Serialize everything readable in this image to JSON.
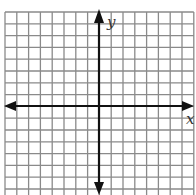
{
  "diagram": {
    "type": "coordinate-plane",
    "labels": {
      "x_axis": "x",
      "y_axis": "y"
    },
    "grid": {
      "columns": 16,
      "rows_visible": 16,
      "origin_px": [
        99,
        106
      ],
      "cell_px": 11.8,
      "grid_left_px": 5,
      "grid_top_px": 12,
      "tick_labels": false
    },
    "colors": {
      "background": "#ffffff",
      "grid_line": "#8a8a8a",
      "axis": "#111111",
      "label": "#333333"
    }
  }
}
